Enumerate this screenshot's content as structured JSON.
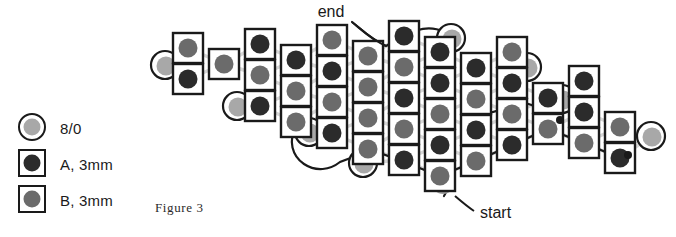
{
  "figure": {
    "caption": "Figure  3",
    "annotations": {
      "start": "start",
      "end": "end"
    }
  },
  "legend": {
    "items": [
      {
        "label": "8/0",
        "shape": "circle",
        "bead_color": "#a8a8a8",
        "icon": "seed-bead-circle-icon"
      },
      {
        "label": "A, 3mm",
        "shape": "square",
        "bead_color": "#2b2b2b",
        "icon": "bead-a-square-icon"
      },
      {
        "label": "B, 3mm",
        "shape": "square",
        "bead_color": "#6b6b6b",
        "icon": "bead-b-square-icon"
      }
    ]
  },
  "colors": {
    "outline": "#1a1a1a",
    "bead_a": "#2b2b2b",
    "bead_b": "#6b6b6b",
    "bead_seed": "#a8a8a8",
    "thread_light": "#d6d6d6",
    "thread_dark": "#1a1a1a",
    "background": "#ffffff"
  },
  "diagram": {
    "type": "beading-pattern",
    "cell_size": 30,
    "squares": [
      {
        "x": 173,
        "y": 33,
        "type": "B"
      },
      {
        "x": 173,
        "y": 64,
        "type": "A"
      },
      {
        "x": 209,
        "y": 49,
        "type": "B"
      },
      {
        "x": 245,
        "y": 29,
        "type": "A"
      },
      {
        "x": 245,
        "y": 60,
        "type": "B"
      },
      {
        "x": 245,
        "y": 91,
        "type": "A"
      },
      {
        "x": 281,
        "y": 45,
        "type": "A"
      },
      {
        "x": 281,
        "y": 76,
        "type": "B"
      },
      {
        "x": 281,
        "y": 107,
        "type": "B"
      },
      {
        "x": 317,
        "y": 25,
        "type": "B"
      },
      {
        "x": 317,
        "y": 56,
        "type": "A"
      },
      {
        "x": 317,
        "y": 87,
        "type": "B"
      },
      {
        "x": 317,
        "y": 118,
        "type": "A"
      },
      {
        "x": 353,
        "y": 41,
        "type": "B"
      },
      {
        "x": 353,
        "y": 72,
        "type": "B"
      },
      {
        "x": 353,
        "y": 103,
        "type": "B"
      },
      {
        "x": 353,
        "y": 134,
        "type": "B"
      },
      {
        "x": 389,
        "y": 21,
        "type": "A"
      },
      {
        "x": 389,
        "y": 52,
        "type": "B"
      },
      {
        "x": 389,
        "y": 83,
        "type": "A"
      },
      {
        "x": 389,
        "y": 114,
        "type": "B"
      },
      {
        "x": 389,
        "y": 145,
        "type": "A"
      },
      {
        "x": 425,
        "y": 37,
        "type": "A"
      },
      {
        "x": 425,
        "y": 68,
        "type": "A"
      },
      {
        "x": 425,
        "y": 99,
        "type": "B"
      },
      {
        "x": 425,
        "y": 130,
        "type": "A"
      },
      {
        "x": 425,
        "y": 161,
        "type": "B"
      },
      {
        "x": 461,
        "y": 53,
        "type": "A"
      },
      {
        "x": 461,
        "y": 84,
        "type": "B"
      },
      {
        "x": 461,
        "y": 115,
        "type": "A"
      },
      {
        "x": 461,
        "y": 146,
        "type": "B"
      },
      {
        "x": 497,
        "y": 37,
        "type": "B"
      },
      {
        "x": 497,
        "y": 68,
        "type": "A"
      },
      {
        "x": 497,
        "y": 99,
        "type": "B"
      },
      {
        "x": 497,
        "y": 130,
        "type": "A"
      },
      {
        "x": 533,
        "y": 83,
        "type": "A"
      },
      {
        "x": 533,
        "y": 114,
        "type": "B"
      },
      {
        "x": 569,
        "y": 66,
        "type": "A"
      },
      {
        "x": 569,
        "y": 97,
        "type": "A"
      },
      {
        "x": 569,
        "y": 128,
        "type": "B"
      },
      {
        "x": 605,
        "y": 112,
        "type": "B"
      },
      {
        "x": 605,
        "y": 143,
        "type": "A"
      }
    ],
    "seed_beads": [
      {
        "x": 150,
        "y": 50
      },
      {
        "x": 222,
        "y": 91
      },
      {
        "x": 294,
        "y": 117
      },
      {
        "x": 348,
        "y": 148
      },
      {
        "x": 436,
        "y": 23
      },
      {
        "x": 512,
        "y": 52
      },
      {
        "x": 547,
        "y": 84
      },
      {
        "x": 636,
        "y": 121
      }
    ],
    "free_beads": [
      {
        "x": 443,
        "y": 183,
        "label": "start"
      }
    ],
    "knots": [
      {
        "x": 560,
        "y": 120
      },
      {
        "x": 628,
        "y": 155
      }
    ]
  }
}
